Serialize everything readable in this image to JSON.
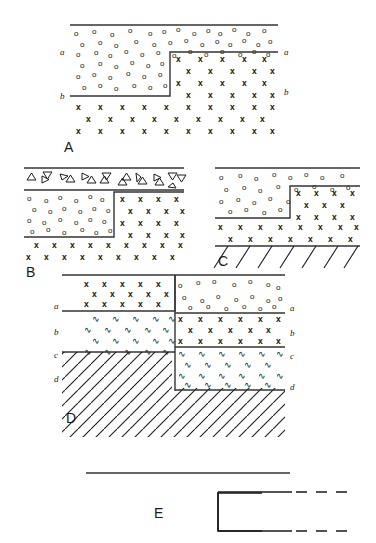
{
  "figure": {
    "title": "",
    "panels": [
      {
        "id": "A",
        "letter": "A",
        "left_labels": [
          "a",
          "b"
        ],
        "right_labels": [
          "a",
          "b"
        ],
        "units": [
          {
            "name": "a",
            "pattern": "circles",
            "symbol": "o"
          },
          {
            "name": "b",
            "pattern": "crosses",
            "symbol": "x"
          }
        ],
        "structure": "step-fault with bed a thinning against bed b across vertical fault"
      },
      {
        "id": "B",
        "letter": "B",
        "left_labels": [],
        "right_labels": [],
        "units": [
          {
            "name": "top",
            "pattern": "triangles",
            "symbol": "△"
          },
          {
            "name": "middle",
            "pattern": "circles",
            "symbol": "o"
          },
          {
            "name": "lower",
            "pattern": "crosses",
            "symbol": "x"
          }
        ],
        "structure": "step-fault overlain by triangular-clast unit"
      },
      {
        "id": "C",
        "letter": "C",
        "left_labels": [],
        "right_labels": [],
        "units": [
          {
            "name": "top",
            "pattern": "circles",
            "symbol": "o"
          },
          {
            "name": "middle",
            "pattern": "crosses",
            "symbol": "x"
          },
          {
            "name": "base",
            "pattern": "hachured-basement",
            "symbol": "/"
          }
        ],
        "structure": "step-fault above hachured basement contact"
      },
      {
        "id": "D",
        "letter": "D",
        "left_labels": [
          "a",
          "b",
          "c",
          "d"
        ],
        "right_labels": [
          "a",
          "b",
          "c",
          "d"
        ],
        "units": [
          {
            "name": "a",
            "pattern": "crosses-left-circles-right",
            "symbol": "x / o"
          },
          {
            "name": "b",
            "pattern": "wavy-left-crosses-right",
            "symbol": "∿ / x"
          },
          {
            "name": "c",
            "pattern": "wavy",
            "symbol": "∿"
          },
          {
            "name": "d",
            "pattern": "diagonal-hatch",
            "symbol": "/"
          }
        ],
        "structure": "normal fault offsetting four beds a-d, downthrown to the right"
      },
      {
        "id": "E",
        "letter": "E",
        "left_labels": [],
        "right_labels": [],
        "units": [],
        "structure": "solid line above; open-ended box with dashed projections to the right"
      }
    ],
    "colors": {
      "ink": "#1a1a1a",
      "line": "#333333",
      "background": "#ffffff"
    },
    "line_styles": {
      "solid": "solid contact",
      "dashed": "inferred / projected contact"
    }
  }
}
